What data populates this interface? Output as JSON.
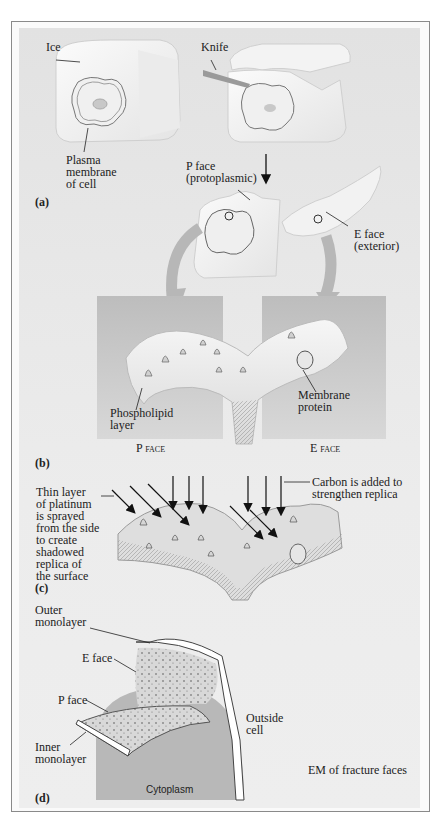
{
  "figure": {
    "panel_a": {
      "letter": "(a)",
      "labels": {
        "ice": "Ice",
        "knife": "Knife",
        "plasma_membrane": [
          "Plasma",
          "membrane",
          "of cell"
        ],
        "p_face": [
          "P face",
          "(protoplasmic)"
        ],
        "e_face": [
          "E face",
          "(exterior)"
        ]
      }
    },
    "panel_b": {
      "letter": "(b)",
      "labels": {
        "phospholipid": [
          "Phospholipid",
          "layer"
        ],
        "membrane_protein": [
          "Membrane",
          "protein"
        ],
        "p_face_caption": "P face",
        "e_face_caption": "E face"
      }
    },
    "panel_c": {
      "letter": "(c)",
      "labels": {
        "platinum": [
          "Thin layer",
          "of platinum",
          "is sprayed",
          "from the side",
          "to create",
          "shadowed",
          "replica of",
          "the surface"
        ],
        "carbon": [
          "Carbon is added to",
          "strengthen replica"
        ]
      }
    },
    "panel_d": {
      "letter": "(d)",
      "labels": {
        "outer_monolayer": [
          "Outer",
          "monolayer"
        ],
        "e_face": "E face",
        "p_face": "P face",
        "inner_monolayer": [
          "Inner",
          "monolayer"
        ],
        "outside_cell": [
          "Outside",
          "cell"
        ],
        "cytoplasm": "Cytoplasm",
        "em_caption": "EM of fracture faces"
      }
    }
  }
}
